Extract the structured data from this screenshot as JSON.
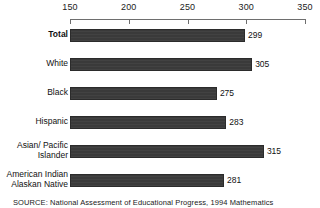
{
  "chart_data": {
    "type": "bar",
    "orientation": "horizontal",
    "title": "",
    "xlabel": "",
    "ylabel": "",
    "xlim": [
      150,
      350
    ],
    "ticks": [
      150,
      200,
      250,
      300,
      350
    ],
    "tick_labels": [
      "150",
      "200",
      "250",
      "300",
      "350"
    ],
    "grid": false,
    "legend": false,
    "categories": [
      "Total",
      "White",
      "Black",
      "Hispanic",
      "Asian/ Pacific\nIslander",
      "American Indian\nAlaskan Native"
    ],
    "values": [
      299,
      305,
      275,
      283,
      315,
      281
    ],
    "value_labels": [
      "299",
      "305",
      "275",
      "283",
      "315",
      "281"
    ],
    "bar_color": "#3a3a3a",
    "emphasis_category": "Total"
  },
  "axis": {
    "ticks": [
      {
        "label": "150",
        "value": 150
      },
      {
        "label": "200",
        "value": 200
      },
      {
        "label": "250",
        "value": 250
      },
      {
        "label": "300",
        "value": 300
      },
      {
        "label": "350",
        "value": 350
      }
    ]
  },
  "rows": [
    {
      "label": "Total",
      "value_label": "299",
      "bold": true,
      "lines": 1
    },
    {
      "label": "White",
      "value_label": "305",
      "bold": false,
      "lines": 1
    },
    {
      "label": "Black",
      "value_label": "275",
      "bold": false,
      "lines": 1
    },
    {
      "label": "Hispanic",
      "value_label": "283",
      "bold": false,
      "lines": 1
    },
    {
      "label": "Asian/ Pacific\nIslander",
      "value_label": "315",
      "bold": false,
      "lines": 2
    },
    {
      "label": "American Indian\nAlaskan Native",
      "value_label": "281",
      "bold": false,
      "lines": 2
    }
  ],
  "footer": {
    "source": "SOURCE:  National Assessment of Educational Progress, 1994 Mathematics"
  }
}
